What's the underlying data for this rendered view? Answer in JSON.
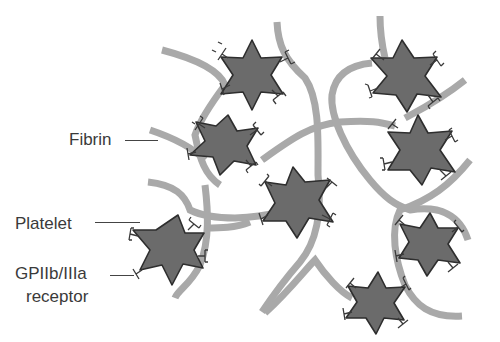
{
  "figure": {
    "labels": {
      "fibrin": "Fibrin",
      "platelet": "Platelet",
      "receptor_line1": "GPIIb/IIIa",
      "receptor_line2": "receptor"
    },
    "colors": {
      "fibrin": "#a9a9a9",
      "platelet_fill": "#6b6b6b",
      "platelet_stroke": "#2e2e2e",
      "receptor": "#3a3a3a",
      "text": "#3a3a3a"
    },
    "platelets": [
      {
        "x": 252,
        "y": 72,
        "r": 33
      },
      {
        "x": 222,
        "y": 143,
        "r": 31
      },
      {
        "x": 408,
        "y": 75,
        "r": 35
      },
      {
        "x": 425,
        "y": 147,
        "r": 34
      },
      {
        "x": 300,
        "y": 202,
        "r": 36
      },
      {
        "x": 165,
        "y": 248,
        "r": 36
      },
      {
        "x": 432,
        "y": 240,
        "r": 31
      },
      {
        "x": 382,
        "y": 298,
        "r": 33
      }
    ]
  }
}
